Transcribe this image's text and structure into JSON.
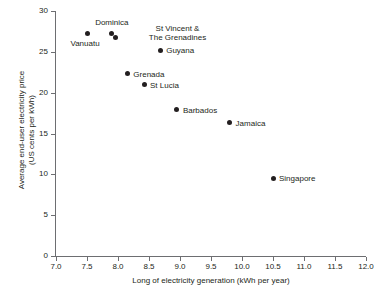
{
  "chart_data": {
    "type": "scatter",
    "title": "",
    "xlabel": "Long of electricity generation (kWh per year)",
    "ylabel": "Average end-user electricity price\n(US cents per kWh)",
    "ylabel_line1": "Average end-user electricity price",
    "ylabel_line2": "(US cents per kWh)",
    "xlim": [
      7.0,
      12.0
    ],
    "ylim": [
      0,
      30
    ],
    "xticks": [
      "7.0",
      "7.5",
      "8.0",
      "8.5",
      "9.0",
      "9.5",
      "10.0",
      "10.5",
      "11.0",
      "11.5",
      "12.0"
    ],
    "xtick_values": [
      7.0,
      7.5,
      8.0,
      8.5,
      9.0,
      9.5,
      10.0,
      10.5,
      11.0,
      11.5,
      12.0
    ],
    "yticks": [
      "0",
      "5",
      "10",
      "15",
      "20",
      "25",
      "30"
    ],
    "ytick_values": [
      0,
      5,
      10,
      15,
      20,
      25,
      30
    ],
    "grid": false,
    "legend": "none",
    "marker_color": "#231f20",
    "axis_color": "#6d6e71",
    "points": [
      {
        "label": "Vanuatu",
        "x": 7.5,
        "y": 27.3,
        "label_lines": [
          "Vanuatu"
        ],
        "label_pos": "below-left"
      },
      {
        "label": "Dominica",
        "x": 7.9,
        "y": 27.3,
        "label_lines": [
          "Dominica"
        ],
        "label_pos": "above"
      },
      {
        "label": "St Vincent & The Grenadines",
        "x": 7.96,
        "y": 26.8,
        "label_lines": [
          "St Vincent &",
          "The Grenadines"
        ],
        "label_pos": "right-two-line"
      },
      {
        "label": "Guyana",
        "x": 8.68,
        "y": 25.2,
        "label_lines": [
          "Guyana"
        ],
        "label_pos": "right"
      },
      {
        "label": "Grenada",
        "x": 8.15,
        "y": 22.3,
        "label_lines": [
          "Grenada"
        ],
        "label_pos": "right"
      },
      {
        "label": "St Lucia",
        "x": 8.42,
        "y": 21.0,
        "label_lines": [
          "St Lucia"
        ],
        "label_pos": "right"
      },
      {
        "label": "Barbados",
        "x": 8.95,
        "y": 17.9,
        "label_lines": [
          "Barbados"
        ],
        "label_pos": "right"
      },
      {
        "label": "Jamaica",
        "x": 9.8,
        "y": 16.3,
        "label_lines": [
          "Jamaica"
        ],
        "label_pos": "right"
      },
      {
        "label": "Singapore",
        "x": 10.5,
        "y": 9.5,
        "label_lines": [
          "Singapore"
        ],
        "label_pos": "right"
      }
    ]
  }
}
